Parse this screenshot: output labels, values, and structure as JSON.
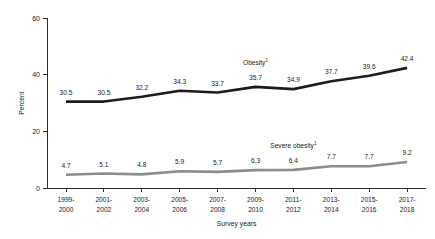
{
  "chart_data": {
    "type": "line",
    "title": "",
    "xlabel": "Survey years",
    "ylabel": "Percent",
    "ylim": [
      0,
      60
    ],
    "yticks": [
      0,
      20,
      40,
      60
    ],
    "ytick_labels": [
      "0",
      "20",
      "40",
      "60"
    ],
    "grid": false,
    "legend": "inline-series-labels",
    "categories": [
      "1999-\n2000",
      "2001-\n2002",
      "2003-\n2004",
      "2005-\n2006",
      "2007-\n2008",
      "2009-\n2010",
      "2011-\n2012",
      "2013-\n2014",
      "2015-\n2016",
      "2017-\n2018"
    ],
    "xtick_labels_line1": [
      "1999-",
      "2001-",
      "2003-",
      "2005-",
      "2007-",
      "2009-",
      "2011-",
      "2013-",
      "2015-",
      "2017-"
    ],
    "xtick_labels_line2": [
      "2000",
      "2002",
      "2004",
      "2006",
      "2008",
      "2010",
      "2012",
      "2014",
      "2016",
      "2018"
    ],
    "series": [
      {
        "name": "Obesity",
        "name_superscript": "1",
        "color": "#1c1c1c",
        "stroke_width": 2.6,
        "values": [
          30.5,
          30.5,
          32.2,
          34.3,
          33.7,
          35.7,
          34.9,
          37.7,
          39.6,
          42.4
        ],
        "value_labels": [
          "30.5",
          "30.5",
          "32.2",
          "34.3",
          "33.7",
          "35.7",
          "34.9",
          "37.7",
          "39.6",
          "42.4"
        ],
        "label_text": "Obesity",
        "label_x_index": 5,
        "label_offset_y": -22
      },
      {
        "name": "Severe obesity",
        "name_superscript": "1",
        "color": "#8c8c8c",
        "stroke_width": 2.6,
        "values": [
          4.7,
          5.1,
          4.8,
          5.9,
          5.7,
          6.3,
          6.4,
          7.7,
          7.7,
          9.2
        ],
        "value_labels": [
          "4.7",
          "5.1",
          "4.8",
          "5.9",
          "5.7",
          "6.3",
          "6.4",
          "7.7",
          "7.7",
          "9.2"
        ],
        "label_text": "Severe obesity",
        "label_x_index": 6,
        "label_offset_y": -22
      }
    ]
  }
}
